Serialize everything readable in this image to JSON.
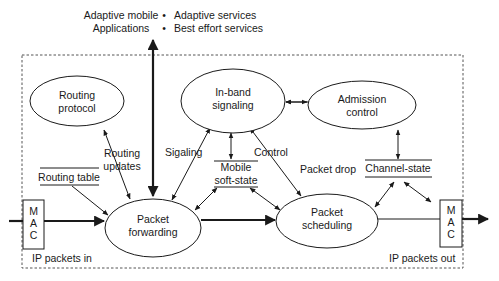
{
  "top_labels": {
    "applications_line1": "Adaptive mobile",
    "applications_line2": "Applications",
    "bullet": "•",
    "services": [
      "Adaptive services",
      "Best effort services"
    ]
  },
  "nodes": {
    "routing_protocol": [
      "Routing",
      "protocol"
    ],
    "inband_signaling": [
      "In-band",
      "signaling"
    ],
    "admission_control": [
      "Admission",
      "control"
    ],
    "packet_forwarding": [
      "Packet",
      "forwarding"
    ],
    "packet_scheduling": [
      "Packet",
      "scheduling"
    ]
  },
  "stores": {
    "routing_table": "Routing table",
    "mobile_soft_state": [
      "Mobile",
      "soft-state"
    ],
    "channel_state": "Channel-state"
  },
  "mac_left": [
    "M",
    "A",
    "C"
  ],
  "mac_right": [
    "M",
    "A",
    "C"
  ],
  "edge_labels": {
    "routing_updates": [
      "Routing",
      "updates"
    ],
    "signaling": "Sigaling",
    "control": "Control",
    "packet_drop": "Packet drop"
  },
  "io_labels": {
    "in": "IP packets in",
    "out": "IP packets out"
  },
  "colors": {
    "ink": "#1a1a1a",
    "boundary": "#555555",
    "background": "#ffffff"
  }
}
